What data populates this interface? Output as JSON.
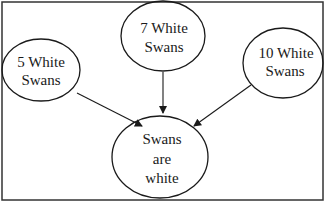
{
  "diagram": {
    "type": "inductive-reasoning",
    "colors": {
      "stroke": "#1a1a1a",
      "background": "#ffffff",
      "frame": "#333333"
    },
    "nodes": [
      {
        "id": "obs-5",
        "lines": [
          "5 White",
          "Swans"
        ]
      },
      {
        "id": "obs-7",
        "lines": [
          "7 White",
          "Swans"
        ]
      },
      {
        "id": "obs-10",
        "lines": [
          "10 White",
          "Swans"
        ]
      },
      {
        "id": "conclusion",
        "lines": [
          "Swans",
          "are",
          "white"
        ]
      }
    ],
    "edges": [
      {
        "from": "obs-5",
        "to": "conclusion"
      },
      {
        "from": "obs-7",
        "to": "conclusion"
      },
      {
        "from": "obs-10",
        "to": "conclusion"
      }
    ]
  }
}
